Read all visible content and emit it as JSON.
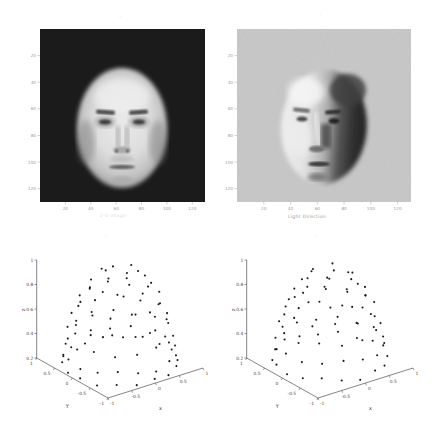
{
  "figure": {
    "background": "#ffffff"
  },
  "colors": {
    "panel1_bg": "#1b1b1b",
    "panel2_bg": "#c7c7c7",
    "marker": "#1c1c1c",
    "axis": "#333333",
    "image_tick": "#a5a5a5",
    "face_light": "#e9e9e9",
    "face_shadow": "#2e2e2e"
  },
  "panels": {
    "face_image": {
      "title_mark": "'",
      "caption": "2-D image"
    },
    "face_lit": {
      "title_mark": "'",
      "caption": "Light Direction"
    },
    "scatter_left": {
      "title_mark": "'"
    },
    "scatter_right": {
      "title_mark": "'"
    }
  },
  "chart_data": [
    {
      "type": "image",
      "label": "frontal face image on dark background",
      "x_ticks": [
        20,
        40,
        60,
        80,
        100,
        120
      ],
      "y_ticks": [
        20,
        40,
        60,
        80,
        100,
        120
      ],
      "xlabel": "2-D image"
    },
    {
      "type": "image",
      "label": "side-illuminated face image on light background",
      "x_ticks": [
        20,
        40,
        60,
        80,
        100,
        120
      ],
      "y_ticks": [
        20,
        40,
        60,
        80,
        100,
        120
      ],
      "xlabel": "Light Direction"
    },
    {
      "type": "scatter",
      "projection": "3d",
      "xlabel": "x",
      "ylabel": "Y",
      "zlabel": "z",
      "x_ticks": [
        -1,
        -0.5,
        0,
        0.5,
        1
      ],
      "y_ticks": [
        1,
        0.5,
        0,
        -0.5,
        -1
      ],
      "z_ticks": [
        0.2,
        0.4,
        0.6,
        0.8,
        1
      ],
      "xlim": [
        -1,
        1
      ],
      "ylim": [
        -1,
        1
      ],
      "zlim": [
        0.2,
        1
      ],
      "points": [
        [
          0.3,
          0.08,
          0.95
        ],
        [
          0.08,
          0.3,
          0.93
        ],
        [
          -0.219,
          0.219,
          0.96
        ],
        [
          -0.3,
          -0.08,
          0.94
        ],
        [
          -0.08,
          -0.299,
          0.95
        ],
        [
          0.219,
          -0.219,
          0.96
        ],
        [
          0.527,
          0,
          0.85
        ],
        [
          0.404,
          0.339,
          0.83
        ],
        [
          0.092,
          0.519,
          0.86
        ],
        [
          -0.264,
          0.456,
          0.84
        ],
        [
          -0.495,
          0.18,
          0.85
        ],
        [
          -0.495,
          -0.18,
          0.87
        ],
        [
          -0.264,
          -0.456,
          0.85
        ],
        [
          0.092,
          -0.519,
          0.84
        ],
        [
          0.404,
          -0.339,
          0.86
        ],
        [
          0.684,
          0.121,
          0.72
        ],
        [
          0.532,
          0.446,
          0.7
        ],
        [
          0.237,
          0.652,
          0.73
        ],
        [
          -0.121,
          0.684,
          0.71
        ],
        [
          -0.446,
          0.532,
          0.72
        ],
        [
          -0.652,
          0.237,
          0.74
        ],
        [
          -0.684,
          -0.121,
          0.72
        ],
        [
          -0.532,
          -0.446,
          0.7
        ],
        [
          -0.237,
          -0.652,
          0.73
        ],
        [
          0.121,
          -0.684,
          0.71
        ],
        [
          0.446,
          -0.532,
          0.72
        ],
        [
          0.652,
          -0.237,
          0.74
        ],
        [
          0.815,
          0,
          0.58
        ],
        [
          0.72,
          0.382,
          0.56
        ],
        [
          0.456,
          0.676,
          0.59
        ],
        [
          0.086,
          0.811,
          0.57
        ],
        [
          -0.306,
          0.756,
          0.58
        ],
        [
          -0.624,
          0.524,
          0.6
        ],
        [
          -0.797,
          0.17,
          0.58
        ],
        [
          -0.783,
          -0.225,
          0.56
        ],
        [
          -0.586,
          -0.566,
          0.59
        ],
        [
          -0.252,
          -0.775,
          0.57
        ],
        [
          0.142,
          -0.803,
          0.58
        ],
        [
          0.502,
          -0.642,
          0.6
        ],
        [
          0.745,
          -0.332,
          0.57
        ],
        [
          0.878,
          0.187,
          0.44
        ],
        [
          0.726,
          0.528,
          0.42
        ],
        [
          0.449,
          0.778,
          0.45
        ],
        [
          0.094,
          0.894,
          0.43
        ],
        [
          -0.277,
          0.854,
          0.44
        ],
        [
          -0.601,
          0.667,
          0.46
        ],
        [
          -0.821,
          0.365,
          0.44
        ],
        [
          -0.898,
          0,
          0.42
        ],
        [
          -0.821,
          -0.365,
          0.45
        ],
        [
          -0.601,
          -0.667,
          0.43
        ],
        [
          -0.277,
          -0.854,
          0.44
        ],
        [
          0.094,
          -0.894,
          0.46
        ],
        [
          0.449,
          -0.778,
          0.44
        ],
        [
          0.726,
          -0.528,
          0.42
        ],
        [
          0.878,
          -0.187,
          0.45
        ],
        [
          0.954,
          0,
          0.3
        ],
        [
          0.891,
          0.342,
          0.28
        ],
        [
          0.709,
          0.638,
          0.31
        ],
        [
          0.433,
          0.85,
          0.29
        ],
        [
          0.1,
          0.949,
          0.3
        ],
        [
          -0.247,
          0.922,
          0.32
        ],
        [
          -0.561,
          0.772,
          0.3
        ],
        [
          -0.8,
          0.52,
          0.28
        ],
        [
          -0.933,
          0.198,
          0.31
        ],
        [
          -0.943,
          -0.149,
          0.29
        ],
        [
          -0.826,
          -0.477,
          0.3
        ],
        [
          -0.6,
          -0.741,
          0.32
        ],
        [
          -0.295,
          -0.907,
          0.3
        ],
        [
          0.05,
          -0.953,
          0.28
        ],
        [
          0.388,
          -0.872,
          0.31
        ],
        [
          0.675,
          -0.675,
          0.29
        ],
        [
          0.872,
          -0.388,
          0.3
        ],
        [
          0.963,
          0.17,
          0.21
        ],
        [
          0.847,
          0.489,
          0.23
        ],
        [
          0.629,
          0.749,
          0.21
        ],
        [
          0.334,
          0.919,
          0.22
        ],
        [
          0,
          0.978,
          0.2
        ],
        [
          -0.334,
          0.919,
          0.22
        ],
        [
          -0.629,
          0.749,
          0.21
        ],
        [
          -0.847,
          0.489,
          0.23
        ],
        [
          -0.963,
          0.17,
          0.21
        ],
        [
          -0.963,
          -0.17,
          0.22
        ],
        [
          -0.847,
          -0.489,
          0.2
        ],
        [
          -0.629,
          -0.749,
          0.22
        ],
        [
          -0.334,
          -0.919,
          0.21
        ],
        [
          0,
          -0.978,
          0.23
        ],
        [
          0.334,
          -0.919,
          0.21
        ],
        [
          0.629,
          -0.749,
          0.22
        ],
        [
          0.847,
          -0.489,
          0.2
        ],
        [
          0.963,
          -0.17,
          0.22
        ]
      ]
    },
    {
      "type": "scatter",
      "projection": "3d",
      "xlabel": "x",
      "ylabel": "Y",
      "zlabel": "z",
      "x_ticks": [
        -1,
        -0.5,
        0,
        0.5,
        1
      ],
      "y_ticks": [
        1,
        0.5,
        0,
        -0.5,
        -1
      ],
      "z_ticks": [
        0.2,
        0.4,
        0.6,
        0.8,
        1
      ],
      "xlim": [
        -1,
        1
      ],
      "ylim": [
        -1,
        1
      ],
      "zlim": [
        0.2,
        1
      ],
      "points": [
        [
          0.221,
          0.221,
          0.95
        ],
        [
          -0.221,
          0.221,
          0.94
        ],
        [
          -0.221,
          -0.221,
          0.96
        ],
        [
          0.221,
          -0.221,
          0.95
        ],
        [
          0.475,
          0,
          0.88
        ],
        [
          0.336,
          0.336,
          0.86
        ],
        [
          0,
          0.475,
          0.89
        ],
        [
          -0.336,
          0.336,
          0.87
        ],
        [
          -0.475,
          0,
          0.88
        ],
        [
          -0.336,
          -0.336,
          0.9
        ],
        [
          0,
          -0.475,
          0.88
        ],
        [
          0.336,
          -0.336,
          0.86
        ],
        [
          0.595,
          0.193,
          0.78
        ],
        [
          0.368,
          0.506,
          0.76
        ],
        [
          0,
          0.626,
          0.79
        ],
        [
          -0.368,
          0.506,
          0.77
        ],
        [
          -0.595,
          0.193,
          0.78
        ],
        [
          -0.595,
          -0.193,
          0.8
        ],
        [
          -0.368,
          -0.506,
          0.78
        ],
        [
          0,
          -0.626,
          0.76
        ],
        [
          0.368,
          -0.506,
          0.79
        ],
        [
          0.595,
          -0.193,
          0.78
        ],
        [
          0.751,
          0,
          0.66
        ],
        [
          0.65,
          0.376,
          0.64
        ],
        [
          0.376,
          0.65,
          0.67
        ],
        [
          0,
          0.751,
          0.65
        ],
        [
          -0.376,
          0.65,
          0.66
        ],
        [
          -0.65,
          0.376,
          0.68
        ],
        [
          -0.751,
          0,
          0.66
        ],
        [
          -0.65,
          -0.376,
          0.64
        ],
        [
          -0.376,
          -0.65,
          0.67
        ],
        [
          0,
          -0.751,
          0.65
        ],
        [
          0.376,
          -0.65,
          0.66
        ],
        [
          0.65,
          -0.376,
          0.68
        ],
        [
          0.832,
          0.192,
          0.52
        ],
        [
          0.664,
          0.537,
          0.5
        ],
        [
          0.361,
          0.774,
          0.53
        ],
        [
          -0.015,
          0.854,
          0.51
        ],
        [
          -0.388,
          0.761,
          0.52
        ],
        [
          -0.682,
          0.514,
          0.54
        ],
        [
          -0.839,
          0.163,
          0.52
        ],
        [
          -0.825,
          -0.221,
          0.5
        ],
        [
          -0.645,
          -0.56,
          0.53
        ],
        [
          -0.334,
          -0.787,
          0.51
        ],
        [
          0.044,
          -0.853,
          0.52
        ],
        [
          0.414,
          -0.747,
          0.54
        ],
        [
          0.699,
          -0.49,
          0.52
        ],
        [
          0.844,
          -0.133,
          0.5
        ],
        [
          0.925,
          0,
          0.38
        ],
        [
          0.855,
          0.354,
          0.36
        ],
        [
          0.654,
          0.654,
          0.39
        ],
        [
          0.354,
          0.855,
          0.37
        ],
        [
          0,
          0.925,
          0.38
        ],
        [
          -0.354,
          0.855,
          0.4
        ],
        [
          -0.654,
          0.654,
          0.38
        ],
        [
          -0.855,
          0.354,
          0.36
        ],
        [
          -0.925,
          0,
          0.39
        ],
        [
          -0.855,
          -0.354,
          0.37
        ],
        [
          -0.654,
          -0.654,
          0.38
        ],
        [
          -0.354,
          -0.855,
          0.4
        ],
        [
          0,
          -0.925,
          0.38
        ],
        [
          0.354,
          -0.855,
          0.36
        ],
        [
          0.654,
          -0.654,
          0.39
        ],
        [
          0.855,
          -0.354,
          0.37
        ],
        [
          0.964,
          0.084,
          0.25
        ],
        [
          0.877,
          0.409,
          0.23
        ],
        [
          0.684,
          0.684,
          0.26
        ],
        [
          0.409,
          0.877,
          0.24
        ],
        [
          0.084,
          0.964,
          0.25
        ],
        [
          -0.251,
          0.935,
          0.27
        ],
        [
          -0.556,
          0.793,
          0.25
        ],
        [
          -0.793,
          0.556,
          0.23
        ],
        [
          -0.935,
          0.251,
          0.26
        ],
        [
          -0.964,
          -0.084,
          0.24
        ],
        [
          -0.877,
          -0.409,
          0.25
        ],
        [
          -0.684,
          -0.684,
          0.27
        ],
        [
          -0.409,
          -0.877,
          0.25
        ],
        [
          -0.084,
          -0.964,
          0.23
        ],
        [
          0.251,
          -0.935,
          0.26
        ],
        [
          0.556,
          -0.793,
          0.24
        ],
        [
          0.793,
          -0.556,
          0.25
        ],
        [
          0.935,
          -0.251,
          0.27
        ]
      ]
    }
  ]
}
